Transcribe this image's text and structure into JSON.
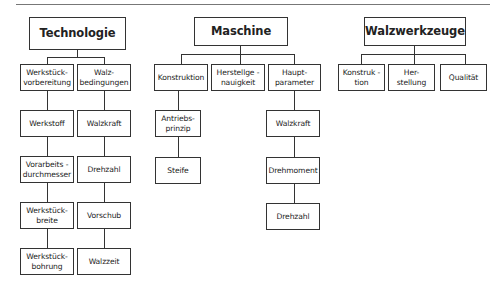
{
  "header": {
    "text": ""
  },
  "trees": [
    {
      "root": "Technologie",
      "columns": [
        {
          "items": [
            "Werkstück-\nvorbereitung",
            "Werkstoff",
            "Vorarbeits -\ndurchmesser",
            "Werkstück-\nbreite",
            "Werkstück-\nbohrung"
          ]
        },
        {
          "items": [
            "Walz-\nbedingungen",
            "Walzkraft",
            "Drehzahl",
            "Vorschub",
            "Walzzeit"
          ]
        }
      ]
    },
    {
      "root": "Maschine",
      "columns": [
        {
          "items": [
            "Konstruktion",
            "Antriebs-\nprinzip",
            "Steife"
          ]
        },
        {
          "items": [
            "Herstellge -\nnauigkeit"
          ]
        },
        {
          "items": [
            "Haupt-\nparameter",
            "Walzkraft",
            "Drehmoment",
            "Drehzahl"
          ]
        }
      ]
    },
    {
      "root": "Walzwerkzeuge",
      "columns": [
        {
          "items": [
            "Konstruk -\ntion"
          ]
        },
        {
          "items": [
            "Her-\nstellung"
          ]
        },
        {
          "items": [
            "Qualität"
          ]
        }
      ]
    }
  ]
}
